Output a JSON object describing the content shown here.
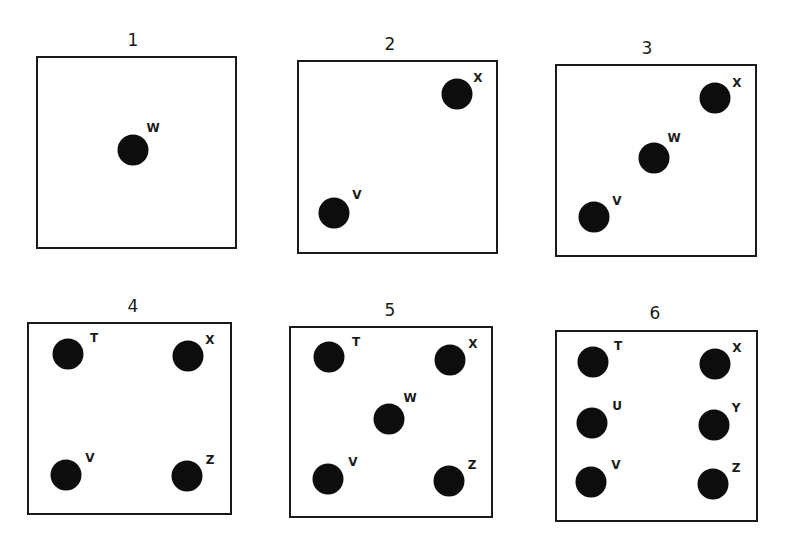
{
  "panels": [
    {
      "title": "1",
      "title_pos": [
        133,
        40
      ],
      "box": [
        36,
        56,
        201,
        193
      ],
      "dots": [
        {
          "label": "W",
          "pos": [
            133,
            150
          ],
          "label_pos": [
            153,
            128
          ]
        }
      ]
    },
    {
      "title": "2",
      "title_pos": [
        390,
        44
      ],
      "box": [
        297,
        60,
        201,
        194
      ],
      "dots": [
        {
          "label": "X",
          "pos": [
            457,
            94
          ],
          "label_pos": [
            478,
            78
          ]
        },
        {
          "label": "V",
          "pos": [
            334,
            213
          ],
          "label_pos": [
            357,
            195
          ]
        }
      ]
    },
    {
      "title": "3",
      "title_pos": [
        647,
        48
      ],
      "box": [
        555,
        64,
        202,
        193
      ],
      "dots": [
        {
          "label": "X",
          "pos": [
            715,
            98
          ],
          "label_pos": [
            737,
            83
          ]
        },
        {
          "label": "W",
          "pos": [
            654,
            158
          ],
          "label_pos": [
            674,
            138
          ]
        },
        {
          "label": "V",
          "pos": [
            594,
            217
          ],
          "label_pos": [
            617,
            201
          ]
        }
      ]
    },
    {
      "title": "4",
      "title_pos": [
        133,
        306
      ],
      "box": [
        27,
        322,
        205,
        193
      ],
      "dots": [
        {
          "label": "T",
          "pos": [
            68,
            354
          ],
          "label_pos": [
            94,
            338
          ]
        },
        {
          "label": "X",
          "pos": [
            188,
            356
          ],
          "label_pos": [
            210,
            340
          ]
        },
        {
          "label": "V",
          "pos": [
            66,
            475
          ],
          "label_pos": [
            90,
            458
          ]
        },
        {
          "label": "Z",
          "pos": [
            187,
            476
          ],
          "label_pos": [
            210,
            460
          ]
        }
      ]
    },
    {
      "title": "5",
      "title_pos": [
        390,
        310
      ],
      "box": [
        289,
        326,
        204,
        192
      ],
      "dots": [
        {
          "label": "T",
          "pos": [
            329,
            357
          ],
          "label_pos": [
            356,
            342
          ]
        },
        {
          "label": "X",
          "pos": [
            450,
            360
          ],
          "label_pos": [
            473,
            344
          ]
        },
        {
          "label": "W",
          "pos": [
            389,
            419
          ],
          "label_pos": [
            410,
            398
          ]
        },
        {
          "label": "V",
          "pos": [
            328,
            479
          ],
          "label_pos": [
            353,
            462
          ]
        },
        {
          "label": "Z",
          "pos": [
            449,
            481
          ],
          "label_pos": [
            472,
            465
          ]
        }
      ]
    },
    {
      "title": "6",
      "title_pos": [
        655,
        313
      ],
      "box": [
        555,
        330,
        203,
        192
      ],
      "dots": [
        {
          "label": "T",
          "pos": [
            593,
            362
          ],
          "label_pos": [
            618,
            346
          ]
        },
        {
          "label": "X",
          "pos": [
            715,
            364
          ],
          "label_pos": [
            737,
            348
          ]
        },
        {
          "label": "U",
          "pos": [
            592,
            423
          ],
          "label_pos": [
            617,
            406
          ]
        },
        {
          "label": "Y",
          "pos": [
            714,
            425
          ],
          "label_pos": [
            736,
            408
          ]
        },
        {
          "label": "V",
          "pos": [
            591,
            482
          ],
          "label_pos": [
            616,
            465
          ]
        },
        {
          "label": "Z",
          "pos": [
            713,
            484
          ],
          "label_pos": [
            736,
            468
          ]
        }
      ]
    }
  ]
}
